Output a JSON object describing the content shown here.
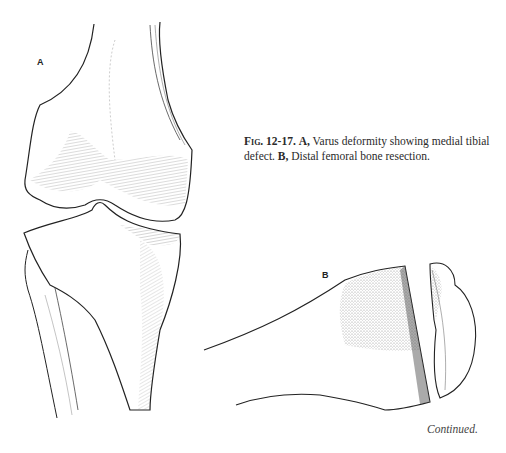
{
  "figure": {
    "panel_a_label": "A",
    "panel_b_label": "B",
    "caption": {
      "figure_number": "Fig. 12-17.",
      "part_a_label": "A,",
      "part_a_text": "Varus deformity showing medial tibial defect.",
      "part_b_label": "B,",
      "part_b_text": "Distal femoral bone resection."
    },
    "footer": "Continued."
  }
}
